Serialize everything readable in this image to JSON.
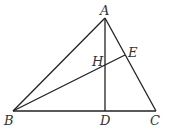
{
  "diagram": {
    "type": "geometry-triangle",
    "points": {
      "A": {
        "label": "A"
      },
      "B": {
        "label": "B"
      },
      "C": {
        "label": "C"
      },
      "D": {
        "label": "D"
      },
      "E": {
        "label": "E"
      },
      "H": {
        "label": "H"
      }
    },
    "segments": [
      "AB",
      "AC",
      "BC",
      "AD",
      "BE"
    ]
  }
}
